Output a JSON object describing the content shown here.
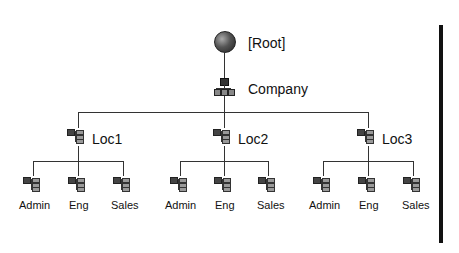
{
  "root": {
    "label": "[Root]",
    "icon": "globe-icon"
  },
  "company": {
    "label": "Company",
    "icon": "organization-icon"
  },
  "locations": [
    {
      "label": "Loc1",
      "icon": "organizational-unit-icon",
      "children": [
        {
          "label": "Admin"
        },
        {
          "label": "Eng"
        },
        {
          "label": "Sales"
        }
      ]
    },
    {
      "label": "Loc2",
      "icon": "organizational-unit-icon",
      "children": [
        {
          "label": "Admin"
        },
        {
          "label": "Eng"
        },
        {
          "label": "Sales"
        }
      ]
    },
    {
      "label": "Loc3",
      "icon": "organizational-unit-icon",
      "children": [
        {
          "label": "Admin"
        },
        {
          "label": "Eng"
        },
        {
          "label": "Sales"
        }
      ]
    }
  ],
  "colors": {
    "line": "#333333",
    "bar": "#111111",
    "background": "#ffffff"
  }
}
